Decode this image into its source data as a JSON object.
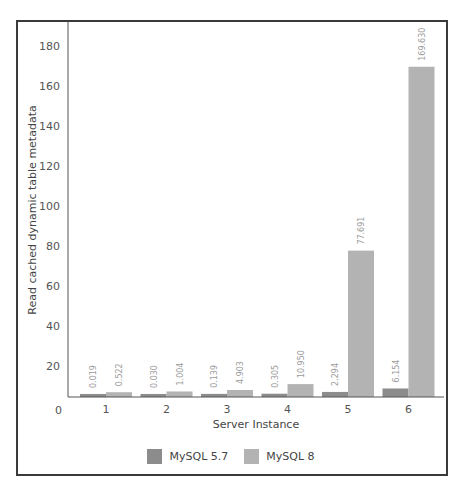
{
  "chart_data": {
    "type": "bar",
    "title": "",
    "xlabel": "Server Instance",
    "ylabel": "Read cached dynamic table metadata",
    "categories": [
      "1",
      "2",
      "3",
      "4",
      "5",
      "6"
    ],
    "series": [
      {
        "name": "MySQL 5.7",
        "color": "#8c8c8c",
        "values": [
          0.019,
          0.03,
          0.139,
          0.305,
          2.294,
          6.154
        ],
        "labels": [
          "0.019",
          "0.030",
          "0.139",
          "0.305",
          "2.294",
          "6.154"
        ]
      },
      {
        "name": "MySQL 8",
        "color": "#b3b3b3",
        "values": [
          0.522,
          1.004,
          4.903,
          10.95,
          77.691,
          169.63
        ],
        "labels": [
          "0.522",
          "1.004",
          "4.903",
          "10.950",
          "77.691",
          "169.630"
        ]
      }
    ],
    "yticks": [
      0,
      20,
      40,
      60,
      80,
      100,
      120,
      140,
      160,
      180
    ],
    "ylim": [
      0,
      180
    ],
    "grid": false,
    "legend_position": "bottom"
  },
  "legend": {
    "items": [
      {
        "label": "MySQL 5.7",
        "color": "#8c8c8c"
      },
      {
        "label": "MySQL 8",
        "color": "#b3b3b3"
      }
    ]
  }
}
